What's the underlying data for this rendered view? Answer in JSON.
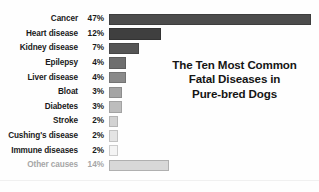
{
  "chart_data": {
    "type": "bar",
    "orientation": "horizontal",
    "title": "The Ten Most Common Fatal Diseases in Pure-bred Dogs",
    "title_lines": [
      "The Ten Most Common",
      "Fatal Diseases in",
      "Pure-bred Dogs"
    ],
    "xlabel": "",
    "ylabel": "",
    "grid": false,
    "legend": false,
    "xlim": [
      0,
      47
    ],
    "value_unit": "%",
    "categories": [
      "Cancer",
      "Heart disease",
      "Kidney disease",
      "Epilepsy",
      "Liver disease",
      "Bloat",
      "Diabetes",
      "Stroke",
      "Cushing's disease",
      "Immune diseases",
      "Other causes"
    ],
    "values": [
      47,
      12,
      7,
      4,
      4,
      3,
      3,
      2,
      2,
      2,
      14
    ],
    "value_labels": [
      "47%",
      "12%",
      "7%",
      "4%",
      "4%",
      "3%",
      "3%",
      "2%",
      "2%",
      "2%",
      "14%"
    ],
    "bars": [
      {
        "label": "Cancer",
        "value": 47,
        "value_label": "47%",
        "color": "#4c4c4c",
        "border": "#3d3d3d",
        "muted": false
      },
      {
        "label": "Heart disease",
        "value": 12,
        "value_label": "12%",
        "color": "#3f3f3f",
        "border": "#333333",
        "muted": false
      },
      {
        "label": "Kidney disease",
        "value": 7,
        "value_label": "7%",
        "color": "#555555",
        "border": "#464646",
        "muted": false
      },
      {
        "label": "Epilepsy",
        "value": 4,
        "value_label": "4%",
        "color": "#6e6e6e",
        "border": "#5c5c5c",
        "muted": false
      },
      {
        "label": "Liver disease",
        "value": 4,
        "value_label": "4%",
        "color": "#8a8a8a",
        "border": "#747474",
        "muted": false
      },
      {
        "label": "Bloat",
        "value": 3,
        "value_label": "3%",
        "color": "#a5a5a5",
        "border": "#8d8d8d",
        "muted": false
      },
      {
        "label": "Diabetes",
        "value": 3,
        "value_label": "3%",
        "color": "#bdbdbd",
        "border": "#a3a3a3",
        "muted": false
      },
      {
        "label": "Stroke",
        "value": 2,
        "value_label": "2%",
        "color": "#d2d2d2",
        "border": "#b4b4b4",
        "muted": false
      },
      {
        "label": "Cushing's disease",
        "value": 2,
        "value_label": "2%",
        "color": "#e4e4e4",
        "border": "#c2c2c2",
        "muted": false
      },
      {
        "label": "Immune diseases",
        "value": 2,
        "value_label": "2%",
        "color": "#f4f4f4",
        "border": "#cccccc",
        "muted": false
      },
      {
        "label": "Other causes",
        "value": 14,
        "value_label": "14%",
        "color": "#d8d8d8",
        "border": "#b0b0b0",
        "muted": true
      }
    ],
    "colors": {
      "background": "#fefefe",
      "label_text": "#1a1a1a",
      "muted_text": "#a6a6a6",
      "title_text": "#151515",
      "baseline": "#f0f0f0"
    }
  }
}
